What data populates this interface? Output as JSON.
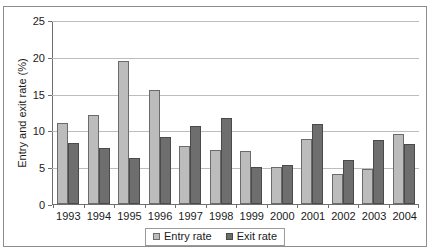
{
  "title_sliver": "",
  "legend": {
    "position": "bottom",
    "entry_label": "Entry rate",
    "exit_label": "Exit rate"
  },
  "axes": {
    "ylabel": "Entry and exit rate (%)",
    "yticks": [
      "25",
      "20",
      "15",
      "10",
      "5",
      "0"
    ],
    "xlabel": ""
  },
  "colors": {
    "entry": "#bcbcbc",
    "exit": "#6e6e6e",
    "grid": "#bdbdbd",
    "axis": "#6f6f6f",
    "frame": "#8d8d8d"
  },
  "chart_data": {
    "type": "bar",
    "title": "",
    "xlabel": "",
    "ylabel": "Entry and exit rate (%)",
    "ylim": [
      0,
      25
    ],
    "ytick_step": 5,
    "grid": true,
    "legend_position": "bottom",
    "categories": [
      "1993",
      "1994",
      "1995",
      "1996",
      "1997",
      "1998",
      "1999",
      "2000",
      "2001",
      "2002",
      "2003",
      "2004"
    ],
    "series": [
      {
        "name": "Entry rate",
        "color": "#bcbcbc",
        "values": [
          11.1,
          12.2,
          19.5,
          15.6,
          7.9,
          7.4,
          7.3,
          5.1,
          8.9,
          4.1,
          4.8,
          9.5
        ]
      },
      {
        "name": "Exit rate",
        "color": "#6e6e6e",
        "values": [
          8.3,
          7.7,
          6.3,
          9.1,
          10.6,
          11.8,
          5.1,
          5.3,
          10.9,
          6.0,
          8.8,
          8.2
        ]
      }
    ]
  }
}
